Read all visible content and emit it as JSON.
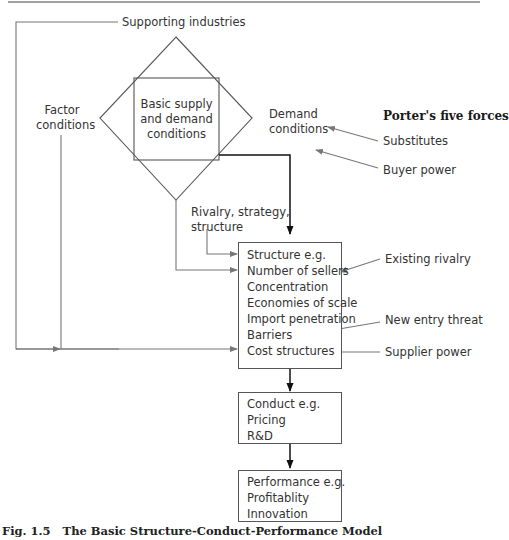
{
  "diagram": {
    "top_rule": true,
    "nodes": {
      "supporting_industries": "Supporting industries",
      "factor_conditions": [
        "Factor",
        "conditions"
      ],
      "basic_conditions": [
        "Basic supply",
        "and demand",
        "conditions"
      ],
      "demand_conditions": [
        "Demand",
        "conditions"
      ],
      "rivalry": [
        "Rivalry, strategy,",
        "structure"
      ]
    },
    "porter": {
      "title": "Porter's five forces",
      "substitutes": "Substitutes",
      "buyer_power": "Buyer power",
      "existing_rivalry": "Existing rivalry",
      "new_entry_threat": "New entry threat",
      "supplier_power": "Supplier power"
    },
    "structure_box": {
      "lines": [
        "Structure e.g.",
        "Number of sellers",
        "Concentration",
        "Economies of scale",
        "Import penetration",
        "Barriers",
        "Cost structures"
      ]
    },
    "conduct_box": {
      "lines": [
        "Conduct e.g.",
        "Pricing",
        "R&D"
      ]
    },
    "performance_box": {
      "lines": [
        "Performance e.g.",
        "Profitablity",
        "Innovation"
      ]
    },
    "caption": {
      "label": "Fig. 1.5",
      "title": "The Basic Structure-Conduct-Performance Model"
    },
    "colors": {
      "line": "#555555",
      "arrow_gray": "#777777",
      "arrow_black": "#111111"
    }
  }
}
